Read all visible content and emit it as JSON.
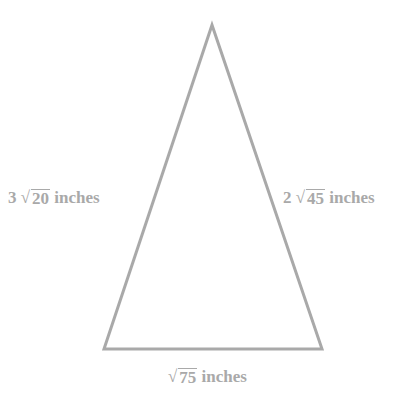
{
  "diagram": {
    "type": "triangle",
    "stroke_color": "#a9a9a9",
    "label_color": "#a9a9a9",
    "vertices": {
      "apex": [
        212,
        25
      ],
      "bottom_left": [
        104,
        349
      ],
      "bottom_right": [
        322,
        349
      ]
    },
    "sides": {
      "left": {
        "coefficient": "3",
        "radical_sign": "√",
        "radicand": "20",
        "unit": "inches"
      },
      "right": {
        "coefficient": "2",
        "radical_sign": "√",
        "radicand": "45",
        "unit": "inches"
      },
      "bottom": {
        "coefficient": "",
        "radical_sign": "√",
        "radicand": "75",
        "unit": "inches"
      }
    }
  }
}
